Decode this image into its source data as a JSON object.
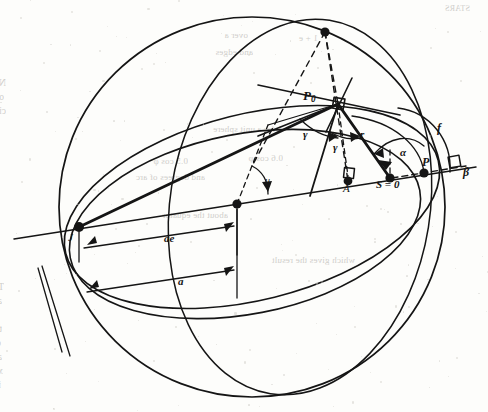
{
  "page": {
    "kind": "scanned-book-page-figure",
    "background_color": "#fdfdfb",
    "ink_color": "#151515",
    "bleed_color": "#8e8c87",
    "width": 488,
    "height": 412
  },
  "figure": {
    "name": "celestial-sphere-orbit-geometry",
    "labels": [
      {
        "id": "P0",
        "text": "P",
        "subscript": "0",
        "x": 303,
        "y": 88,
        "size": 13,
        "style": "bold-italic"
      },
      {
        "id": "gamma1",
        "text": "γ",
        "subscript": "",
        "x": 303,
        "y": 128,
        "size": 11,
        "style": "bold-italic"
      },
      {
        "id": "gamma2",
        "text": "γ",
        "subscript": "",
        "x": 333,
        "y": 141,
        "size": 11,
        "style": "bold-italic"
      },
      {
        "id": "r",
        "text": "r",
        "subscript": "",
        "x": 360,
        "y": 128,
        "size": 11,
        "style": "bold-italic"
      },
      {
        "id": "alpha",
        "text": "α",
        "subscript": "",
        "x": 400,
        "y": 146,
        "size": 11,
        "style": "bold-italic"
      },
      {
        "id": "f",
        "text": "f",
        "subscript": "",
        "x": 437,
        "y": 121,
        "size": 12,
        "style": "bold-italic"
      },
      {
        "id": "P",
        "text": "P",
        "subscript": "",
        "x": 422,
        "y": 155,
        "size": 12,
        "style": "bold-italic"
      },
      {
        "id": "beta",
        "text": "β",
        "subscript": "",
        "x": 463,
        "y": 165,
        "size": 12,
        "style": "bold-italic"
      },
      {
        "id": "S",
        "text": "S = 0",
        "subscript": "",
        "x": 376,
        "y": 178,
        "size": 11,
        "style": "bold-italic"
      },
      {
        "id": "A",
        "text": "A",
        "subscript": "",
        "x": 343,
        "y": 182,
        "size": 11,
        "style": "italic"
      },
      {
        "id": "u",
        "text": "u",
        "subscript": "",
        "x": 265,
        "y": 175,
        "size": 10,
        "style": "italic"
      },
      {
        "id": "J",
        "text": "J",
        "subscript": "",
        "x": 68,
        "y": 231,
        "size": 11,
        "style": "italic"
      },
      {
        "id": "ae",
        "text": "ae",
        "subscript": "",
        "x": 164,
        "y": 232,
        "size": 11,
        "style": "bold-italic"
      },
      {
        "id": "a",
        "text": "a",
        "subscript": "",
        "x": 178,
        "y": 275,
        "size": 11,
        "style": "bold-italic"
      }
    ],
    "points": [
      {
        "id": "pole",
        "x": 325,
        "y": 32
      },
      {
        "id": "P0",
        "x": 338,
        "y": 104
      },
      {
        "id": "A",
        "x": 348,
        "y": 181
      },
      {
        "id": "S",
        "x": 390,
        "y": 178
      },
      {
        "id": "P",
        "x": 424,
        "y": 173
      },
      {
        "id": "center",
        "x": 237,
        "y": 204
      },
      {
        "id": "J",
        "x": 79,
        "y": 227
      }
    ]
  },
  "bleed_text": {
    "note": "faint mirrored show-through from reverse of page",
    "lines": [
      {
        "text": "STARS",
        "x": 470,
        "y": 4,
        "size": 8
      },
      {
        "text": "over a",
        "x": 248,
        "y": 30,
        "size": 9
      },
      {
        "text": "1 + e",
        "x": 318,
        "y": 33,
        "size": 9
      },
      {
        "text": "and edges",
        "x": 253,
        "y": 47,
        "size": 9
      },
      {
        "text": "Now we have a non-zero quantity (1 − e²).  Now imagine the plane",
        "x": 6,
        "y": 78,
        "size": 9.4
      },
      {
        "text": "of the circle inclined at some angle ι to the unit sphere so that the",
        "x": 4,
        "y": 92,
        "size": 9.4
      },
      {
        "text": "circle projects onto the sphere.  The projection onto the sphere traces",
        "x": 6,
        "y": 106,
        "size": 9.4
      },
      {
        "text": "= 1 for a unit sphere",
        "x": 290,
        "y": 124,
        "size": 9
      },
      {
        "text": "0.6 cos φ",
        "x": 283,
        "y": 153,
        "size": 9
      },
      {
        "text": "0.5 cos φ",
        "x": 188,
        "y": 156,
        "size": 9
      },
      {
        "text": "and degrees of arc",
        "x": 205,
        "y": 172,
        "size": 9
      },
      {
        "text": "about the equator",
        "x": 228,
        "y": 210,
        "size": 9
      },
      {
        "text": "which gives the result",
        "x": 355,
        "y": 255,
        "size": 9
      },
      {
        "text": "To that we have to add a further section if we wish to apply it to",
        "x": 4,
        "y": 282,
        "size": 9.4
      },
      {
        "text": "astronomy.  Assume the parallax and we have a relationship between",
        "x": 2,
        "y": 296,
        "size": 9.4
      },
      {
        "text": "the coordinate transformations we may wish to apply and to determine from",
        "x": 0,
        "y": 310,
        "size": 9.4
      },
      {
        "text": "the new values—that is to say the results they will be sensitive to the",
        "x": 2,
        "y": 324,
        "size": 9.4
      },
      {
        "text": "observation.  The final part of this development is the calculation of a small r",
        "x": 1,
        "y": 338,
        "size": 9.4
      },
      {
        "text": "and y, x + y.  Taking the products of the angles forward—they form us with",
        "x": 2,
        "y": 352,
        "size": 9.4
      },
      {
        "text": "x and y—and a less useful for the fourth term—y which we now use to",
        "x": 3,
        "y": 366,
        "size": 9.4
      },
      {
        "text": "interpolates from a fixed point of the sphere as compared with that below.",
        "x": 1,
        "y": 380,
        "size": 9.4
      }
    ]
  }
}
